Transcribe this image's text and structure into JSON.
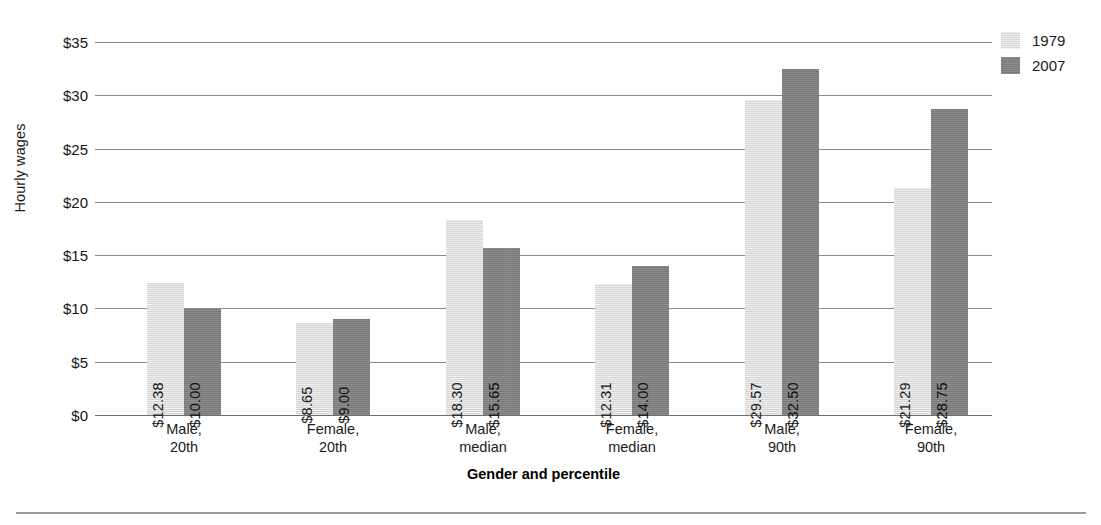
{
  "chart_data": {
    "type": "bar",
    "title": "",
    "xlabel": "Gender and percentile",
    "ylabel": "Hourly wages",
    "categories": [
      "Male, 20th",
      "Female, 20th",
      "Male, median",
      "Female, median",
      "Male, 90th",
      "Female, 90th"
    ],
    "category_lines": [
      [
        "Male,",
        "20th"
      ],
      [
        "Female,",
        "20th"
      ],
      [
        "Male,",
        "median"
      ],
      [
        "Female,",
        "median"
      ],
      [
        "Male,",
        "90th"
      ],
      [
        "Female,",
        "90th"
      ]
    ],
    "series": [
      {
        "name": "1979",
        "color": "#dcdcdc",
        "values": [
          12.38,
          8.65,
          18.3,
          12.31,
          29.57,
          21.29
        ],
        "labels": [
          "$12.38",
          "$8.65",
          "$18.30",
          "$12.31",
          "$29.57",
          "$21.29"
        ]
      },
      {
        "name": "2007",
        "color": "#808080",
        "values": [
          10.0,
          9.0,
          15.65,
          14.0,
          32.5,
          28.75
        ],
        "labels": [
          "$10.00",
          "$9.00",
          "$15.65",
          "$14.00",
          "$32.50",
          "$28.75"
        ]
      }
    ],
    "ylim": [
      0,
      35
    ],
    "yticks": [
      0,
      5,
      10,
      15,
      20,
      25,
      30,
      35
    ],
    "ytick_labels": [
      "$0",
      "$5",
      "$10",
      "$15",
      "$20",
      "$25",
      "$30",
      "$35"
    ],
    "grid": true,
    "legend_position": "right-top"
  },
  "legend": {
    "entries": [
      {
        "label": "1979",
        "color": "#dcdcdc"
      },
      {
        "label": "2007",
        "color": "#808080"
      }
    ]
  },
  "axes": {
    "y_title": "Hourly wages",
    "x_title": "Gender and percentile"
  }
}
